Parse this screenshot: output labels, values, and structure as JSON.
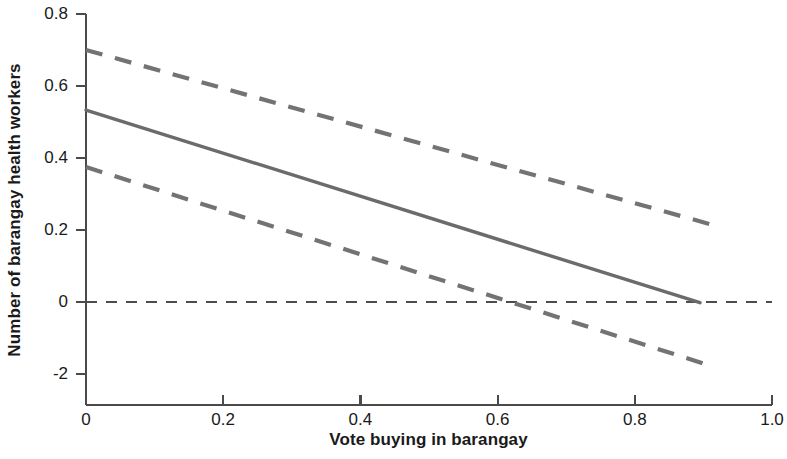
{
  "chart_data": {
    "type": "line",
    "title": "",
    "xlabel": "Vote buying in barangay",
    "ylabel": "Number of barangay health workers",
    "xlim": [
      0,
      1.0
    ],
    "ylim": [
      -0.2,
      0.8
    ],
    "grid": false,
    "legend": "none",
    "x_ticks": [
      {
        "value": 0,
        "label": "0"
      },
      {
        "value": 0.2,
        "label": "0.2"
      },
      {
        "value": 0.4,
        "label": "0.4"
      },
      {
        "value": 0.6,
        "label": "0.6"
      },
      {
        "value": 0.8,
        "label": "0.8"
      },
      {
        "value": 1.0,
        "label": "1.0"
      }
    ],
    "y_ticks": [
      {
        "value": 0.8,
        "label": "0.8"
      },
      {
        "value": 0.6,
        "label": "0.6"
      },
      {
        "value": 0.4,
        "label": "0.4"
      },
      {
        "value": 0.2,
        "label": "0.2"
      },
      {
        "value": 0,
        "label": "0"
      },
      {
        "value": -0.2,
        "label": "-2"
      }
    ],
    "series": [
      {
        "name": "marginal-effect-estimate",
        "style": "solid",
        "color": "#6b6b6b",
        "width": 3.4,
        "x": [
          0,
          0.895
        ],
        "values": [
          0.533,
          -0.002
        ]
      },
      {
        "name": "upper-confidence-bound",
        "style": "dashed",
        "color": "#737373",
        "width": 4.2,
        "x": [
          0,
          0.912
        ],
        "values": [
          0.7,
          0.215
        ]
      },
      {
        "name": "lower-confidence-bound",
        "style": "dashed",
        "color": "#737373",
        "width": 4.2,
        "x": [
          0,
          0.912
        ],
        "values": [
          0.375,
          -0.178
        ]
      }
    ],
    "reference_line": {
      "name": "zero-reference-line",
      "orientation": "horizontal",
      "value": 0,
      "style": "dashed",
      "color": "#4d4d4d",
      "width": 1.8,
      "x_start": 0,
      "x_end": 1.0
    },
    "zero_crossings": {
      "lower_confidence_bound": 0.655,
      "estimate": 0.895
    },
    "axis_color": "#4a4a4a"
  }
}
